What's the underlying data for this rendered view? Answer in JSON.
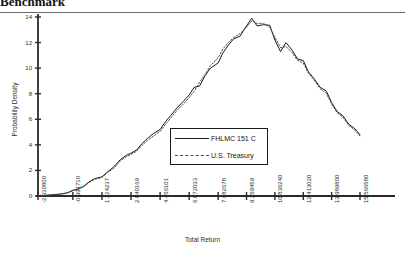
{
  "header": {
    "title": "Benchmark"
  },
  "chart_data": {
    "type": "line",
    "title": "",
    "xlabel": "Total Return",
    "ylabel": "Probability Density",
    "grid": false,
    "legend_position": "center",
    "xlim": [
      -2.3308,
      15.56658
    ],
    "ylim": [
      0,
      14
    ],
    "yticks": [
      0,
      2,
      4,
      6,
      8,
      10,
      12,
      14
    ],
    "xtick_labels": [
      "-2.330800",
      "-0.391710",
      "1.224237",
      "2.840169",
      "4.456101",
      "6.072033",
      "7.682678",
      "9.259459",
      "10.836240",
      "12.413020",
      "13.989800",
      "15.566580"
    ],
    "xtick_values": [
      -2.3308,
      -0.39171,
      1.224237,
      2.840169,
      4.456101,
      6.072033,
      7.682678,
      9.259459,
      10.83624,
      12.41302,
      13.9898,
      15.56658
    ],
    "series": [
      {
        "name": "FHLMC 151 C",
        "style": "solid",
        "color": "#1a1a1a",
        "x": [
          -2.3308,
          -1.9,
          -1.5,
          -1.1,
          -0.7,
          -0.39171,
          -0.1,
          0.2,
          0.5,
          0.8,
          1.224237,
          1.55,
          1.9,
          2.25,
          2.6,
          2.840169,
          3.15,
          3.45,
          3.75,
          4.1,
          4.456101,
          4.75,
          5.05,
          5.4,
          5.75,
          6.072033,
          6.35,
          6.65,
          6.95,
          7.25,
          7.682678,
          7.95,
          8.25,
          8.55,
          8.9,
          9.259459,
          9.55,
          9.85,
          10.2,
          10.55,
          10.83624,
          11.15,
          11.45,
          11.8,
          12.1,
          12.41302,
          12.7,
          13.0,
          13.35,
          13.7,
          13.9898,
          14.3,
          14.6,
          14.95,
          15.25,
          15.56658
        ],
        "y": [
          0.0,
          0.05,
          0.1,
          0.15,
          0.25,
          0.45,
          0.55,
          0.75,
          1.1,
          1.35,
          1.5,
          1.9,
          2.3,
          2.85,
          3.2,
          3.35,
          3.6,
          4.1,
          4.5,
          4.9,
          5.2,
          5.8,
          6.3,
          6.9,
          7.4,
          7.9,
          8.5,
          8.6,
          9.4,
          10.0,
          10.4,
          11.2,
          11.8,
          12.3,
          12.5,
          13.3,
          13.9,
          13.3,
          13.4,
          13.35,
          12.2,
          11.3,
          12.0,
          11.4,
          10.7,
          10.6,
          9.7,
          9.2,
          8.5,
          8.2,
          7.3,
          6.6,
          6.3,
          5.6,
          5.3,
          4.8
        ]
      },
      {
        "name": "U.S. Treasury",
        "style": "dotted",
        "color": "#4a4a4a",
        "x": [
          -2.3308,
          -1.9,
          -1.5,
          -1.1,
          -0.7,
          -0.39171,
          -0.1,
          0.2,
          0.5,
          0.8,
          1.224237,
          1.55,
          1.9,
          2.25,
          2.6,
          2.840169,
          3.15,
          3.45,
          3.75,
          4.1,
          4.456101,
          4.75,
          5.05,
          5.4,
          5.75,
          6.072033,
          6.35,
          6.65,
          6.95,
          7.25,
          7.682678,
          7.95,
          8.25,
          8.55,
          8.9,
          9.259459,
          9.55,
          9.85,
          10.2,
          10.55,
          10.83624,
          11.15,
          11.45,
          11.8,
          12.1,
          12.41302,
          12.7,
          13.0,
          13.35,
          13.7,
          13.9898,
          14.3,
          14.6,
          14.95,
          15.25,
          15.56658
        ],
        "y": [
          0.0,
          0.04,
          0.09,
          0.14,
          0.22,
          0.42,
          0.52,
          0.72,
          1.05,
          1.3,
          1.45,
          1.85,
          2.2,
          2.75,
          3.1,
          3.25,
          3.5,
          3.95,
          4.35,
          4.7,
          5.05,
          5.6,
          6.1,
          6.7,
          7.2,
          7.7,
          8.2,
          8.9,
          9.5,
          10.2,
          10.8,
          11.5,
          12.0,
          12.4,
          12.7,
          13.2,
          13.7,
          13.5,
          13.5,
          13.2,
          12.4,
          11.6,
          11.7,
          11.2,
          10.6,
          10.4,
          9.6,
          9.1,
          8.4,
          8.0,
          7.2,
          6.5,
          6.2,
          5.5,
          5.2,
          4.7
        ]
      }
    ]
  },
  "legend": {
    "entries": [
      {
        "label": "FHLMC 151 C",
        "style": "solid"
      },
      {
        "label": "U.S. Treasury",
        "style": "dotted"
      }
    ]
  }
}
